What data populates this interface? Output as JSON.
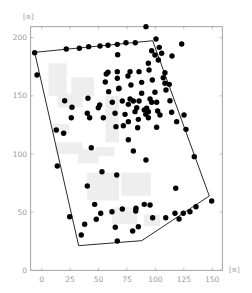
{
  "chart_data": {
    "type": "scatter",
    "title": "",
    "xlabel": "[m]",
    "ylabel": "[m]",
    "xlim": [
      -10,
      160
    ],
    "ylim": [
      0,
      210
    ],
    "x_ticks": [
      0,
      25,
      50,
      75,
      100,
      125,
      150
    ],
    "y_ticks": [
      0,
      50,
      100,
      150,
      200
    ],
    "x_tick_labels": [
      "0",
      "25",
      "50",
      "75",
      "100",
      "125",
      "150"
    ],
    "y_tick_labels": [
      "0",
      "50",
      "100",
      "150",
      "200"
    ],
    "grid": false,
    "legend": null,
    "colors": {
      "points": "#000000",
      "boundary": "#2a2a2a",
      "buildings": "#eeeeee",
      "axis_text": "#9a9a9a"
    },
    "boundary_polygon": [
      [
        -6.2,
        187.4
      ],
      [
        97.6,
        197.4
      ],
      [
        147.4,
        63.9
      ],
      [
        88.0,
        25.5
      ],
      [
        32.5,
        21.2
      ]
    ],
    "buildings": [
      [
        6,
        150,
        16,
        28
      ],
      [
        14,
        140,
        22,
        12
      ],
      [
        26,
        150,
        20,
        16
      ],
      [
        10,
        118,
        14,
        8
      ],
      [
        12,
        100,
        24,
        10
      ],
      [
        32,
        92,
        18,
        12
      ],
      [
        48,
        98,
        16,
        8
      ],
      [
        40,
        60,
        28,
        24
      ],
      [
        70,
        64,
        26,
        20
      ],
      [
        62,
        40,
        22,
        14
      ],
      [
        90,
        38,
        14,
        10
      ],
      [
        56,
        110,
        12,
        40
      ]
    ],
    "points": [
      [
        -6.2,
        187.1
      ],
      [
        -4.1,
        167.9
      ],
      [
        21.6,
        190.3
      ],
      [
        33.1,
        190.9
      ],
      [
        41.3,
        192.3
      ],
      [
        51.3,
        192.9
      ],
      [
        58.3,
        193.5
      ],
      [
        66.5,
        194.3
      ],
      [
        74.1,
        195.7
      ],
      [
        82.3,
        195.7
      ],
      [
        91.7,
        209.5
      ],
      [
        100.5,
        198.9
      ],
      [
        123.1,
        194.6
      ],
      [
        66.8,
        185.4
      ],
      [
        58.3,
        170.3
      ],
      [
        56.8,
        168.8
      ],
      [
        66.5,
        170.8
      ],
      [
        66.5,
        165.1
      ],
      [
        55.9,
        161.9
      ],
      [
        58.9,
        153.6
      ],
      [
        67.7,
        156.1
      ],
      [
        75.9,
        167.1
      ],
      [
        77.7,
        170.8
      ],
      [
        85.6,
        170.8
      ],
      [
        94.4,
        172.2
      ],
      [
        103.4,
        191.7
      ],
      [
        96.7,
        188.8
      ],
      [
        105.5,
        186.6
      ],
      [
        99.6,
        185.1
      ],
      [
        114.6,
        184.3
      ],
      [
        102.6,
        180.8
      ],
      [
        93.8,
        178.0
      ],
      [
        108.4,
        169.9
      ],
      [
        97.3,
        163.6
      ],
      [
        106.9,
        165.6
      ],
      [
        108.4,
        160.8
      ],
      [
        112.2,
        159.9
      ],
      [
        78.5,
        159.3
      ],
      [
        87.9,
        161.6
      ],
      [
        87.9,
        152.2
      ],
      [
        99.6,
        153.1
      ],
      [
        109.3,
        155.0
      ],
      [
        68.0,
        156.5
      ],
      [
        70.9,
        145.6
      ],
      [
        77.7,
        147.3
      ],
      [
        80.6,
        145.6
      ],
      [
        85.6,
        145.6
      ],
      [
        95.3,
        147.3
      ],
      [
        96.7,
        144.5
      ],
      [
        101.1,
        144.5
      ],
      [
        112.8,
        145.8
      ],
      [
        76.2,
        142.7
      ],
      [
        83.6,
        139.8
      ],
      [
        92.3,
        139.3
      ],
      [
        90.2,
        137.8
      ],
      [
        93.8,
        136.4
      ],
      [
        82.1,
        136.4
      ],
      [
        73.3,
        134.1
      ],
      [
        102.0,
        137.0
      ],
      [
        91.5,
        134.1
      ],
      [
        93.8,
        131.2
      ],
      [
        85.0,
        129.8
      ],
      [
        104.0,
        133.5
      ],
      [
        76.2,
        127.8
      ],
      [
        114.3,
        135.9
      ],
      [
        64.5,
        135.0
      ],
      [
        125.2,
        133.5
      ],
      [
        118.7,
        127.8
      ],
      [
        126.9,
        121.2
      ],
      [
        101.1,
        123.0
      ],
      [
        71.8,
        124.3
      ],
      [
        65.3,
        123.5
      ],
      [
        84.4,
        122.6
      ],
      [
        54.2,
        131.2
      ],
      [
        49.8,
        139.8
      ],
      [
        62.1,
        144.5
      ],
      [
        51.0,
        142.1
      ],
      [
        42.2,
        131.2
      ],
      [
        40.1,
        135.0
      ],
      [
        26.0,
        131.2
      ],
      [
        26.6,
        140.2
      ],
      [
        20.2,
        145.8
      ],
      [
        40.7,
        147.9
      ],
      [
        12.8,
        120.6
      ],
      [
        19.3,
        117.8
      ],
      [
        43.6,
        105.4
      ],
      [
        76.2,
        112.2
      ],
      [
        80.6,
        102.6
      ],
      [
        91.7,
        94.8
      ],
      [
        66.0,
        81.9
      ],
      [
        134.2,
        97.7
      ],
      [
        117.9,
        70.5
      ],
      [
        149.5,
        59.6
      ],
      [
        13.7,
        89.7
      ],
      [
        53.0,
        84.8
      ],
      [
        40.1,
        72.5
      ],
      [
        46.6,
        56.7
      ],
      [
        51.9,
        49.0
      ],
      [
        48.0,
        43.9
      ],
      [
        61.8,
        50.4
      ],
      [
        70.9,
        52.7
      ],
      [
        82.9,
        53.3
      ],
      [
        82.7,
        51.0
      ],
      [
        90.2,
        56.7
      ],
      [
        95.3,
        56.1
      ],
      [
        97.6,
        45.2
      ],
      [
        109.1,
        45.2
      ],
      [
        117.2,
        49.0
      ],
      [
        120.8,
        44.1
      ],
      [
        124.5,
        49.0
      ],
      [
        130.4,
        50.4
      ],
      [
        135.7,
        54.7
      ],
      [
        24.6,
        46.1
      ],
      [
        37.8,
        39.6
      ],
      [
        64.7,
        37.0
      ],
      [
        80.0,
        33.8
      ],
      [
        85.0,
        37.5
      ],
      [
        34.8,
        30.4
      ],
      [
        66.5,
        25.2
      ]
    ]
  }
}
